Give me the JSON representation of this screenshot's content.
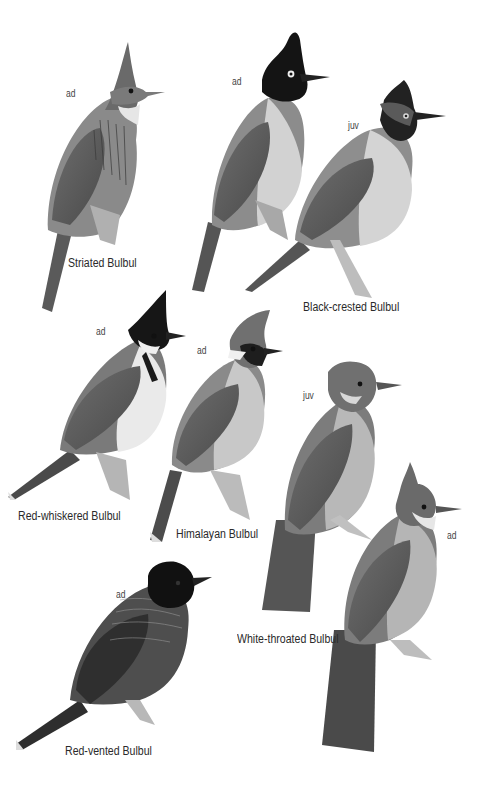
{
  "plate": {
    "background": "#ffffff",
    "species": [
      {
        "name": "Striated Bulbul",
        "age_labels": [
          "ad"
        ]
      },
      {
        "name": "Black-crested Bulbul",
        "age_labels": [
          "ad",
          "juv"
        ]
      },
      {
        "name": "Red-whiskered Bulbul",
        "age_labels": [
          "ad"
        ]
      },
      {
        "name": "Himalayan Bulbul",
        "age_labels": [
          "ad"
        ]
      },
      {
        "name": "White-throated Bulbul",
        "age_labels": [
          "juv",
          "ad"
        ]
      },
      {
        "name": "Red-vented Bulbul",
        "age_labels": [
          "ad"
        ]
      }
    ]
  }
}
